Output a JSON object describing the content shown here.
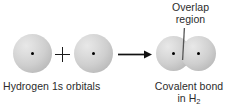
{
  "figure": {
    "background_color": "#ffffff",
    "ink_color": "#2b2b2b",
    "orbital_fill": "#cfcfcf",
    "nucleus_color": "#000000"
  },
  "annotations": {
    "overlap_label_line1": "Overlap",
    "overlap_label_line2": "region",
    "reactants_label": "Hydrogen 1s orbitals",
    "product_label_line1": "Covalent bond",
    "product_label_line2_prefix": "in H",
    "product_label_line2_subscript": "2",
    "plus_symbol": "+",
    "arrow_symbol": "→"
  },
  "diagram": {
    "reactant_orbitals": [
      {
        "id": "orbital-left",
        "name": "hydrogen-1s-orbital",
        "nucleus": true
      },
      {
        "id": "orbital-right",
        "name": "hydrogen-1s-orbital",
        "nucleus": true
      }
    ],
    "product_orbitals": [
      {
        "id": "bond-orbital-left",
        "name": "hydrogen-1s-orbital-bonded",
        "nucleus": true
      },
      {
        "id": "bond-orbital-right",
        "name": "hydrogen-1s-orbital-bonded",
        "nucleus": true
      }
    ]
  }
}
